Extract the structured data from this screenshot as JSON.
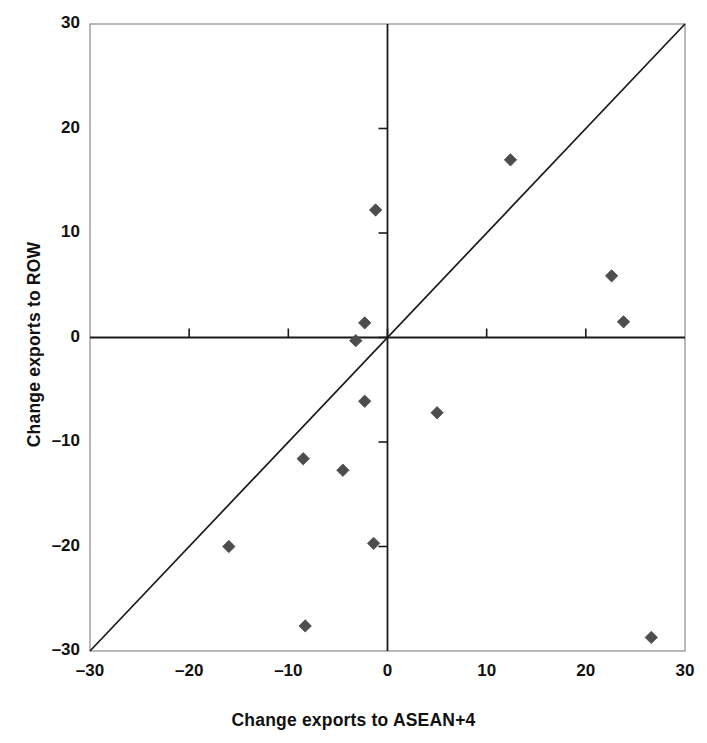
{
  "chart_data": {
    "type": "scatter",
    "title": "",
    "xlabel": "Change exports to ASEAN+4",
    "ylabel": "Change exports to ROW",
    "xlim": [
      -30,
      30
    ],
    "ylim": [
      -30,
      30
    ],
    "xticks": [
      -30,
      -20,
      -10,
      0,
      10,
      20,
      30
    ],
    "yticks": [
      -30,
      -20,
      -10,
      0,
      10,
      20,
      30
    ],
    "xtick_labels": [
      "–30",
      "–20",
      "–10",
      "0",
      "10",
      "20",
      "30"
    ],
    "ytick_labels": [
      "–30",
      "–20",
      "–10",
      "0",
      "10",
      "20",
      "30"
    ],
    "grid": false,
    "legend": "none",
    "marker": "diamond",
    "marker_color": "#4d4d4d",
    "points": [
      {
        "x": -16.0,
        "y": -20.0
      },
      {
        "x": -8.5,
        "y": -11.6
      },
      {
        "x": -8.3,
        "y": -27.6
      },
      {
        "x": -4.5,
        "y": -12.7
      },
      {
        "x": -3.2,
        "y": -0.3
      },
      {
        "x": -2.3,
        "y": 1.4
      },
      {
        "x": -2.3,
        "y": -6.1
      },
      {
        "x": -1.4,
        "y": -19.7
      },
      {
        "x": -1.2,
        "y": 12.2
      },
      {
        "x": 5.0,
        "y": -7.2
      },
      {
        "x": 12.4,
        "y": 17.0
      },
      {
        "x": 22.6,
        "y": 5.9
      },
      {
        "x": 23.8,
        "y": 1.5
      },
      {
        "x": 26.6,
        "y": -28.7
      }
    ],
    "reference_line": {
      "name": "45-degree-line",
      "from": [
        -30,
        -30
      ],
      "to": [
        30,
        30
      ],
      "color": "#1a1a1a"
    },
    "zero_lines": {
      "horizontal_at": 0,
      "vertical_at": 0,
      "color": "#1a1a1a"
    },
    "frame_color": "#8a8a8a",
    "background": "#ffffff"
  },
  "axes": {
    "x_title": "Change exports to ASEAN+4",
    "y_title": "Change exports to ROW"
  }
}
